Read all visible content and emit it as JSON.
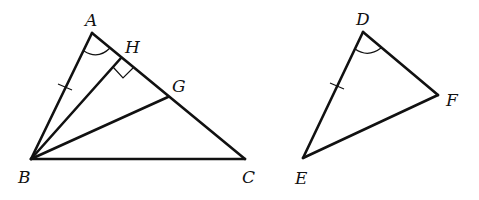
{
  "figure": {
    "left_triangle": {
      "vertices": {
        "A": {
          "label": "A",
          "x": 92,
          "y": 33
        },
        "B": {
          "label": "B",
          "x": 31,
          "y": 159
        },
        "C": {
          "label": "C",
          "x": 245,
          "y": 159
        },
        "H": {
          "label": "H",
          "x": 121,
          "y": 58
        },
        "G": {
          "label": "G",
          "x": 168,
          "y": 97
        }
      },
      "segments": [
        "AB",
        "AC",
        "BC",
        "BH",
        "BG"
      ],
      "marks": {
        "angle_arc": "A",
        "right_angle": "H",
        "tick_mark": "AB"
      }
    },
    "right_triangle": {
      "vertices": {
        "D": {
          "label": "D",
          "x": 363,
          "y": 32
        },
        "E": {
          "label": "E",
          "x": 303,
          "y": 158
        },
        "F": {
          "label": "F",
          "x": 438,
          "y": 95
        }
      },
      "segments": [
        "DE",
        "DF",
        "EF"
      ],
      "marks": {
        "angle_arc": "D",
        "tick_mark": "DE"
      }
    },
    "stroke_color": "#111111",
    "background": "#ffffff"
  }
}
